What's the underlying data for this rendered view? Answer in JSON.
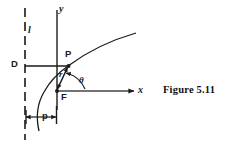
{
  "figure": {
    "caption": "Figure 5.11",
    "background_color": "#ffffff",
    "ink_color": "#1a1a1a"
  },
  "axes": {
    "y_axis_label": "y",
    "x_axis_label": "x",
    "x_axis": {
      "x1": 57,
      "y1": 91,
      "x2": 136,
      "y2": 91,
      "arrow": "right"
    },
    "y_axis": {
      "x1": 57,
      "y1": 10,
      "x2": 57,
      "y2": 110,
      "arrow": "none"
    }
  },
  "directrix": {
    "label": "l",
    "style": "dashed",
    "x": 25,
    "y_top": 8,
    "y_bottom": 140
  },
  "points": {
    "D": {
      "label": "D",
      "x": 25,
      "y": 66
    },
    "P": {
      "label": "P",
      "x": 68,
      "y": 66
    },
    "F": {
      "label": "F",
      "x": 57,
      "y": 91
    }
  },
  "segments": {
    "DP": {
      "from": "D",
      "to": "P",
      "label": "",
      "arrow": "none"
    },
    "FP": {
      "from": "F",
      "to": "P",
      "label": "r",
      "arrow": "double"
    },
    "p_measure": {
      "label": "p",
      "x1": 25,
      "x2": 57,
      "y": 117,
      "arrow": "double"
    }
  },
  "angle": {
    "label": "θ",
    "vertex": "F",
    "from_ray": "x-axis",
    "to_ray": "FP"
  },
  "conic": {
    "type": "conic-section-curve",
    "description": "focus-directrix conic through P opening to the right",
    "path_points": [
      [
        39,
        131
      ],
      [
        37,
        118
      ],
      [
        38,
        107
      ],
      [
        42,
        96
      ],
      [
        48,
        85
      ],
      [
        56,
        76
      ],
      [
        68,
        66
      ],
      [
        82,
        56
      ],
      [
        98,
        46
      ],
      [
        116,
        38
      ],
      [
        135,
        33
      ]
    ]
  }
}
